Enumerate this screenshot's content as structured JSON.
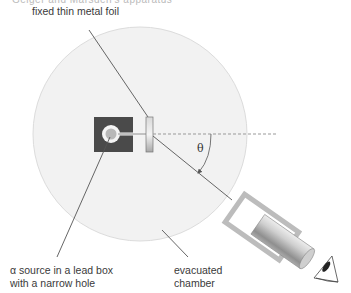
{
  "diagram": {
    "title_cut_off": "Geiger and Marsden's apparatus",
    "labels": {
      "foil": "fixed thin metal foil",
      "source_line1": "α source in a lead box",
      "source_line2": "with a narrow hole",
      "chamber_line1": "evacuated",
      "chamber_line2": "chamber",
      "angle": "θ"
    },
    "components": [
      {
        "name": "evacuated-chamber",
        "shape": "circle",
        "fill": "#f2f2f2",
        "stroke": "#dcdcdc"
      },
      {
        "name": "lead-box",
        "shape": "square",
        "fill": "#4a4a4a"
      },
      {
        "name": "alpha-source",
        "shape": "circle",
        "fill": "#b8b8b8"
      },
      {
        "name": "metal-foil",
        "shape": "rectangle",
        "fill": "#c8c8c8"
      },
      {
        "name": "microscope-detector",
        "shape": "rotated-rectangle",
        "rotation_deg": 35
      },
      {
        "name": "eye",
        "shape": "eye-glyph"
      }
    ],
    "colors": {
      "chamber_fill": "#f2f2f2",
      "chamber_stroke": "#dcdcdc",
      "lead_box": "#4a4a4a",
      "leader_line": "#555555",
      "dashed_line": "#999999"
    }
  }
}
